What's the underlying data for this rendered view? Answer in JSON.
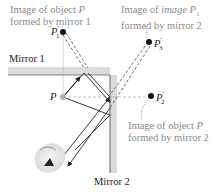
{
  "labels": {
    "image_p1": {
      "line1_prefix": "Image of object ",
      "line1_var": "P",
      "line2": "formed by mirror 1"
    },
    "image_p3": {
      "line1_prefix": "Image of ",
      "line1_italic": "image",
      "line1_var": " P",
      "line1_sub": "1",
      "line1_prime": "′",
      "line2": "formed by mirror 2"
    },
    "image_p2": {
      "line1_prefix": "Image of object ",
      "line1_var": "P",
      "line2": "formed by mirror 2"
    },
    "mirror1": "Mirror 1",
    "mirror2": "Mirror 2"
  },
  "points": {
    "P": {
      "name": "P"
    },
    "P1": {
      "name": "P",
      "sub": "1",
      "prime": "′"
    },
    "P2": {
      "name": "P",
      "sub": "2",
      "prime": "′"
    },
    "P3": {
      "name": "P",
      "sub": "3",
      "prime": "′"
    }
  },
  "colors": {
    "mirror_fill": "#dcdcdc",
    "mirror_line": "#555555",
    "ray": "#222222",
    "virtual_ray": "#444444",
    "label_gray": "#8a8a8a",
    "object_point": "#b0b0b0",
    "image_point": "#111111"
  }
}
